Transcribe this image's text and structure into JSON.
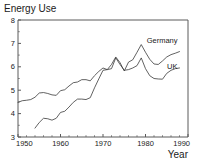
{
  "chart_data": {
    "type": "line",
    "title": "Energy Use",
    "xlabel": "Year",
    "ylabel": "",
    "xlim": [
      1950,
      1990
    ],
    "ylim": [
      3,
      8
    ],
    "grid": false,
    "legend_position": "inline-right",
    "xticks": [
      1950,
      1960,
      1970,
      1980,
      1990
    ],
    "xtick_labels": [
      "1950",
      "1960",
      "1970",
      "1980",
      "1990"
    ],
    "yticks": [
      3,
      4,
      5,
      6,
      7,
      8
    ],
    "ytick_labels": [
      "3",
      "4",
      "5",
      "6",
      "7",
      "8"
    ],
    "series": [
      {
        "name": "UK",
        "label": "UK",
        "x": [
          1950,
          1951,
          1952,
          1953,
          1954,
          1955,
          1956,
          1957,
          1958,
          1959,
          1960,
          1961,
          1962,
          1963,
          1964,
          1965,
          1966,
          1967,
          1968,
          1969,
          1970,
          1971,
          1972,
          1973,
          1974,
          1975,
          1976,
          1977,
          1978,
          1979,
          1980,
          1981,
          1982,
          1983,
          1984,
          1985,
          1986,
          1987,
          1988
        ],
        "y": [
          4.48,
          4.55,
          4.57,
          4.6,
          4.7,
          4.88,
          4.9,
          4.86,
          4.8,
          4.78,
          4.98,
          5.02,
          5.18,
          5.32,
          5.35,
          5.45,
          5.45,
          5.4,
          5.62,
          5.8,
          5.95,
          5.88,
          5.92,
          6.38,
          6.1,
          5.85,
          5.88,
          5.95,
          6.05,
          6.38,
          5.92,
          5.62,
          5.5,
          5.48,
          5.47,
          5.72,
          5.85,
          5.92,
          5.95
        ]
      },
      {
        "name": "Germany",
        "label": "Germany",
        "x": [
          1954,
          1955,
          1956,
          1957,
          1958,
          1959,
          1960,
          1961,
          1962,
          1963,
          1964,
          1965,
          1966,
          1967,
          1968,
          1969,
          1970,
          1971,
          1972,
          1973,
          1974,
          1975,
          1976,
          1977,
          1978,
          1979,
          1980,
          1981,
          1982,
          1983,
          1984,
          1985,
          1986,
          1987,
          1988
        ],
        "y": [
          3.38,
          3.62,
          3.8,
          3.78,
          3.72,
          3.8,
          4.05,
          4.1,
          4.28,
          4.48,
          4.62,
          4.62,
          4.6,
          4.68,
          5.1,
          5.48,
          5.85,
          5.88,
          6.1,
          6.42,
          6.18,
          5.82,
          6.2,
          6.3,
          6.62,
          6.95,
          6.62,
          6.32,
          6.12,
          6.1,
          6.25,
          6.42,
          6.52,
          6.58,
          6.65
        ]
      }
    ],
    "annotations": [
      {
        "text": "Germany",
        "series": "Germany"
      },
      {
        "text": "UK",
        "series": "UK"
      }
    ]
  }
}
